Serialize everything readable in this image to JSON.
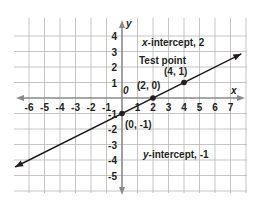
{
  "chart_data": {
    "type": "line",
    "title": "",
    "xlabel": "x",
    "ylabel": "y",
    "origin_label": "0",
    "xlim": [
      -7,
      8
    ],
    "ylim": [
      -6,
      5
    ],
    "grid": true,
    "x_ticks": [
      -6,
      -5,
      -4,
      -3,
      -2,
      -1,
      1,
      2,
      3,
      4,
      5,
      6,
      7
    ],
    "y_ticks": [
      4,
      3,
      2,
      1,
      -1,
      -2,
      -3,
      -4,
      -5
    ],
    "series": [
      {
        "name": "line",
        "equation": "y = x/2 - 1",
        "x": [
          -6.9,
          7.7
        ],
        "y": [
          -4.45,
          2.85
        ],
        "arrows": "both",
        "color": "#231f20"
      }
    ],
    "points": [
      {
        "x": 0,
        "y": -1,
        "label": "(0, -1)"
      },
      {
        "x": 2,
        "y": 0,
        "label": "(2, 0)"
      },
      {
        "x": 4,
        "y": 1,
        "label": "(4, 1)"
      }
    ],
    "annotations": [
      {
        "text_italic": "x",
        "text": "-intercept, 2"
      },
      {
        "text": "Test point"
      },
      {
        "text_italic": "y",
        "text": "-intercept, -1"
      }
    ]
  },
  "labels": {
    "x_axis": "x",
    "y_axis": "y",
    "origin": "0",
    "x_intercept_var": "x",
    "x_intercept_rest": "-intercept, 2",
    "test_point": "Test point",
    "pt_4_1": "(4, 1)",
    "pt_2_0": "(2, 0)",
    "pt_0_m1": "(0, -1)",
    "y_intercept_var": "y",
    "y_intercept_rest": "-intercept, -1"
  },
  "colors": {
    "grid": "#b8b8b8",
    "axis": "#8a8a8a",
    "ink": "#231f20"
  }
}
